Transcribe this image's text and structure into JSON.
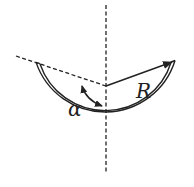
{
  "diagram": {
    "labels": {
      "radius": "R",
      "angle": "α"
    },
    "colors": {
      "stroke": "#222222",
      "background": "#ffffff"
    },
    "geometry": {
      "center": [
        106,
        86
      ],
      "radius": 71
    }
  }
}
